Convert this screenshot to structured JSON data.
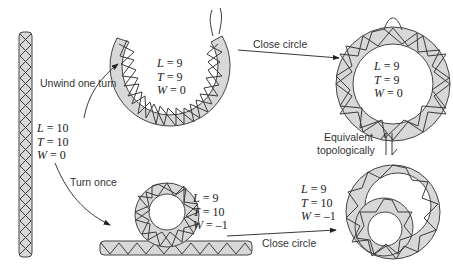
{
  "diagram": {
    "topic": "DNA topology: linking number, twist and writhe",
    "colors": {
      "tube_fill": "#d8d8d8",
      "tube_stroke": "#444444",
      "helix_stroke": "#3a3a3a",
      "arrow": "#222222"
    },
    "states": [
      {
        "id": "linear",
        "L": "L = 10",
        "T": "T = 10",
        "W": "W = 0"
      },
      {
        "id": "open-unwound",
        "L": "L = 9",
        "T": "T = 9",
        "W": "W = 0"
      },
      {
        "id": "closed-relaxed",
        "L": "L = 9",
        "T": "T = 9",
        "W": "W = 0"
      },
      {
        "id": "looped-linear",
        "L": "L = 9",
        "T": "T = 10",
        "W": "W = –1"
      },
      {
        "id": "closed-supercoiled",
        "L": "L = 9",
        "T": "T = 10",
        "W": "W = –1"
      }
    ],
    "arrows": {
      "unwind": "Unwind one turn",
      "close_top": "Close circle",
      "turn": "Turn once",
      "close_bottom": "Close circle",
      "equivalent_line1": "Equivalent",
      "equivalent_line2": "topologically"
    }
  }
}
